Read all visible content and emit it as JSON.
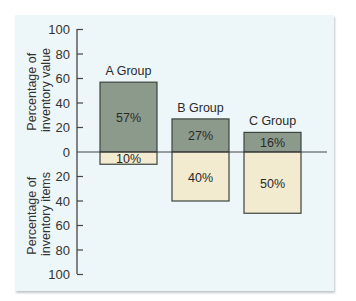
{
  "chart_data": {
    "type": "bar",
    "subtype": "diverging",
    "categories": [
      "A Group",
      "B Group",
      "C Group"
    ],
    "series": [
      {
        "name": "Percentage of inventory value",
        "direction": "up",
        "color": "#8c9a8c",
        "values": [
          57,
          27,
          16
        ]
      },
      {
        "name": "Percentage of inventory items",
        "direction": "down",
        "color": "#f2ebcf",
        "values": [
          10,
          40,
          50
        ]
      }
    ],
    "value_labels": {
      "up": [
        "57%",
        "27%",
        "16%"
      ],
      "down": [
        "10%",
        "40%",
        "50%"
      ]
    },
    "yaxis": {
      "upper_title": [
        "Percentage of",
        "inventory value"
      ],
      "lower_title": [
        "Percentage of",
        "inventory items"
      ],
      "upper_ticks": [
        "100",
        "80",
        "60",
        "40",
        "20",
        "0"
      ],
      "lower_ticks": [
        "20",
        "40",
        "60",
        "80",
        "100"
      ],
      "ylim": [
        -100,
        100
      ]
    },
    "grid": false,
    "legend": "none",
    "background": "#edf7fa"
  }
}
